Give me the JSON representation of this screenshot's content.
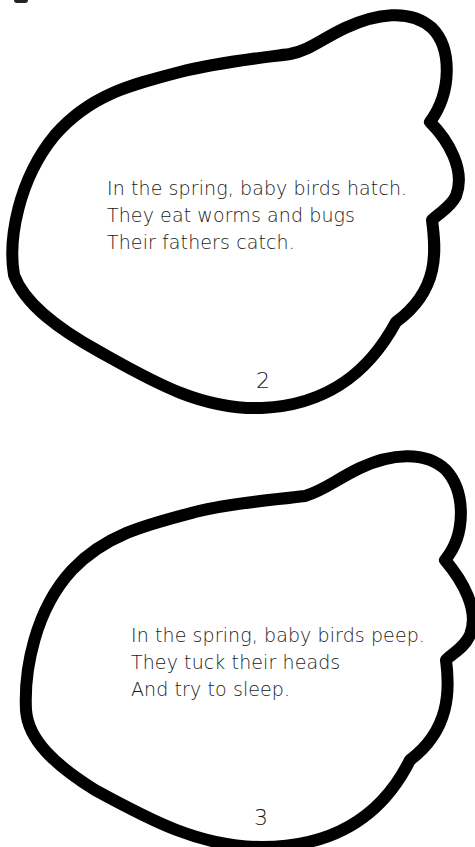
{
  "document": {
    "type": "cut-out booklet pages",
    "shape_stroke_color": "#000000",
    "background_color": "#ffffff",
    "text_color": "#1a1a1a"
  },
  "pages": [
    {
      "page_number": "2",
      "verse": [
        "In the spring, baby birds hatch.",
        "They eat worms and bugs",
        "Their fathers catch."
      ]
    },
    {
      "page_number": "3",
      "verse": [
        "In the spring, baby birds peep.",
        "They tuck their heads",
        "And try to sleep."
      ]
    }
  ]
}
